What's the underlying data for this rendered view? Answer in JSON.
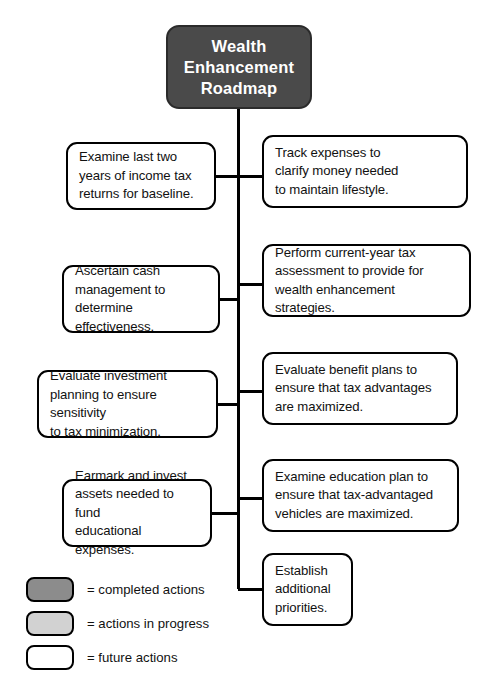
{
  "diagram": {
    "title_node": {
      "label": "Wealth\nEnhancement\nRoadmap",
      "status": "completed",
      "fill_color": "#4a4a4a",
      "text_color": "#ffffff"
    },
    "left_nodes": [
      {
        "label": "Examine last two\nyears of income tax\nreturns for baseline.",
        "status": "future",
        "fill_color": "#ffffff"
      },
      {
        "label": "Ascertain cash\nmanagement to\ndetermine effectiveness.",
        "status": "future",
        "fill_color": "#ffffff"
      },
      {
        "label": "Evaluate investment\nplanning to ensure sensitivity\nto tax minimization.",
        "status": "future",
        "fill_color": "#ffffff"
      },
      {
        "label": "Earmark and invest\nassets needed to fund\neducational expenses.",
        "status": "future",
        "fill_color": "#ffffff"
      }
    ],
    "right_nodes": [
      {
        "label": "Track expenses to\nclarify money needed\nto maintain lifestyle.",
        "status": "future",
        "fill_color": "#ffffff"
      },
      {
        "label": "Perform current-year tax\nassessment to provide for\nwealth enhancement strategies.",
        "status": "future",
        "fill_color": "#ffffff"
      },
      {
        "label": "Evaluate benefit plans to\nensure that tax advantages\nare maximized.",
        "status": "future",
        "fill_color": "#ffffff"
      },
      {
        "label": "Examine education plan to\nensure that tax-advantaged\nvehicles are maximized.",
        "status": "future",
        "fill_color": "#ffffff"
      },
      {
        "label": "Establish\nadditional\npriorities.",
        "status": "future",
        "fill_color": "#ffffff"
      }
    ]
  },
  "legend": {
    "items": [
      {
        "label": "= completed actions",
        "fill_color": "#8c8c8c"
      },
      {
        "label": "= actions in progress",
        "fill_color": "#d2d2d2"
      },
      {
        "label": "= future actions",
        "fill_color": "#ffffff"
      }
    ]
  },
  "colors": {
    "stroke": "#000000",
    "page_background": "#ffffff",
    "root_fill": "#4a4a4a"
  }
}
